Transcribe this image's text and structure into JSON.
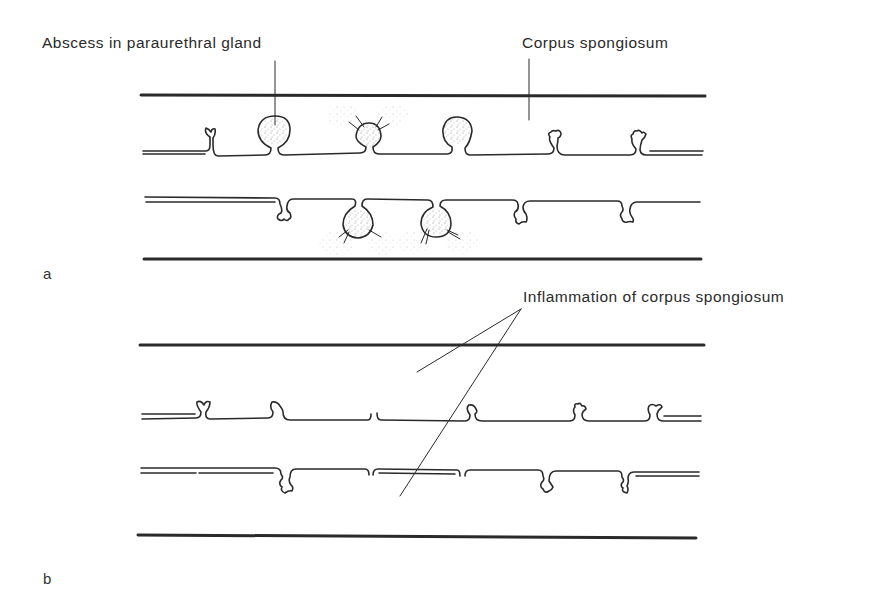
{
  "figure": {
    "panels": [
      {
        "id": "a",
        "letter": "a",
        "labels": {
          "abscess": "Abscess in paraurethral gland",
          "corpus": "Corpus spongiosum"
        }
      },
      {
        "id": "b",
        "letter": "b",
        "labels": {
          "inflammation": "Inflammation of corpus spongiosum"
        }
      }
    ],
    "colors": {
      "ink": "#2a2a2a",
      "stipple": "#8a8a8a",
      "background": "#ffffff"
    }
  }
}
